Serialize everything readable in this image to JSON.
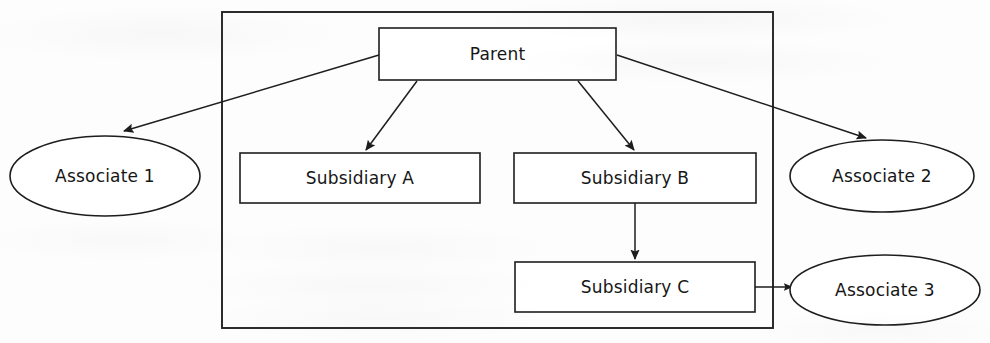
{
  "diagram": {
    "type": "org-chart",
    "canvas": {
      "width": 990,
      "height": 343
    },
    "colors": {
      "background": "#fdfdfd",
      "stroke": "#1d1d1d",
      "frame_stroke": "#222222",
      "node_fill": "#ffffff",
      "text": "#161616"
    },
    "group_frame": {
      "label": "group-boundary",
      "x": 222,
      "y": 12,
      "width": 551,
      "height": 316
    },
    "nodes": [
      {
        "id": "parent",
        "label": "Parent",
        "shape": "rectangle",
        "inside_group": true,
        "x": 379,
        "y": 28,
        "width": 237,
        "height": 52
      },
      {
        "id": "subsidiary-a",
        "label": "Subsidiary A",
        "shape": "rectangle",
        "inside_group": true,
        "x": 240,
        "y": 153,
        "width": 240,
        "height": 50
      },
      {
        "id": "subsidiary-b",
        "label": "Subsidiary B",
        "shape": "rectangle",
        "inside_group": true,
        "x": 514,
        "y": 153,
        "width": 242,
        "height": 50
      },
      {
        "id": "subsidiary-c",
        "label": "Subsidiary C",
        "shape": "rectangle",
        "inside_group": true,
        "x": 515,
        "y": 262,
        "width": 240,
        "height": 50
      },
      {
        "id": "associate-1",
        "label": "Associate 1",
        "shape": "ellipse",
        "inside_group": false,
        "cx": 105,
        "cy": 176,
        "rx": 95,
        "ry": 40
      },
      {
        "id": "associate-2",
        "label": "Associate 2",
        "shape": "ellipse",
        "inside_group": false,
        "cx": 882,
        "cy": 176,
        "rx": 92,
        "ry": 36
      },
      {
        "id": "associate-3",
        "label": "Associate 3",
        "shape": "ellipse",
        "inside_group": false,
        "cx": 885,
        "cy": 290,
        "rx": 95,
        "ry": 35
      }
    ],
    "edges": [
      {
        "id": "parent-to-associate-1",
        "from": "parent",
        "to": "associate-1",
        "arrowhead": "filled-triangle"
      },
      {
        "id": "parent-to-subsidiary-a",
        "from": "parent",
        "to": "subsidiary-a",
        "arrowhead": "filled-triangle"
      },
      {
        "id": "parent-to-subsidiary-b",
        "from": "parent",
        "to": "subsidiary-b",
        "arrowhead": "filled-triangle"
      },
      {
        "id": "parent-to-associate-2",
        "from": "parent",
        "to": "associate-2",
        "arrowhead": "filled-triangle"
      },
      {
        "id": "subsidiary-b-to-subsidiary-c",
        "from": "subsidiary-b",
        "to": "subsidiary-c",
        "arrowhead": "filled-triangle"
      },
      {
        "id": "subsidiary-c-to-associate-3",
        "from": "subsidiary-c",
        "to": "associate-3",
        "arrowhead": "filled-triangle"
      }
    ]
  }
}
